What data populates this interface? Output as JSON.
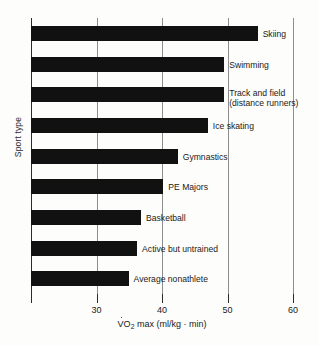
{
  "chart_data": {
    "type": "bar",
    "orientation": "horizontal",
    "title": "",
    "xlabel": "V̇O2 max (ml/kg · min)",
    "xlabel_parts": {
      "pre": "V",
      "sub": "2",
      "post": " max (ml/kg · min)",
      "symbol": "O"
    },
    "ylabel": "Sport type",
    "xlim": [
      20,
      60
    ],
    "xticks": [
      30,
      40,
      50,
      60
    ],
    "xticklabels": [
      "30",
      "40",
      "50",
      "60"
    ],
    "grid": "vertical",
    "legend": "none",
    "bar_color": "#111111",
    "background_color": "#fdfdfb",
    "categories": [
      "Skiing",
      "Swimming",
      "Track and field (distance runners)",
      "Ice skating",
      "Gymnastics",
      "PE Majors",
      "Basketball",
      "Active but untrained",
      "Average nonathlete"
    ],
    "values": [
      54.6,
      49.5,
      49.5,
      47.0,
      42.4,
      40.2,
      36.8,
      36.2,
      34.9
    ],
    "bars": [
      {
        "label": "Skiing",
        "label_line2": "",
        "value": 54.6
      },
      {
        "label": "Swimming",
        "label_line2": "",
        "value": 49.5
      },
      {
        "label": "Track and field",
        "label_line2": "(distance runners)",
        "value": 49.5
      },
      {
        "label": "Ice skating",
        "label_line2": "",
        "value": 47.0
      },
      {
        "label": "Gymnastics",
        "label_line2": "",
        "value": 42.4
      },
      {
        "label": "PE Majors",
        "label_line2": "",
        "value": 40.2
      },
      {
        "label": "Basketball",
        "label_line2": "",
        "value": 36.8
      },
      {
        "label": "Active but untrained",
        "label_line2": "",
        "value": 36.2
      },
      {
        "label": "Average nonathlete",
        "label_line2": "",
        "value": 34.9
      }
    ]
  }
}
